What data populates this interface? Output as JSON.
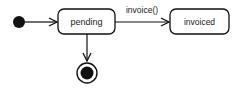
{
  "diagram": {
    "type": "state-machine",
    "states": [
      {
        "id": "initial",
        "kind": "initial"
      },
      {
        "id": "pending",
        "label": "pending"
      },
      {
        "id": "invoiced",
        "label": "invoiced"
      },
      {
        "id": "final",
        "kind": "final"
      }
    ],
    "transitions": [
      {
        "from": "initial",
        "to": "pending",
        "label": ""
      },
      {
        "from": "pending",
        "to": "invoiced",
        "label": "invoice()"
      },
      {
        "from": "pending",
        "to": "final",
        "label": ""
      }
    ],
    "colors": {
      "stroke": "#111111",
      "fill": "#ffffff",
      "text": "#222222"
    }
  }
}
